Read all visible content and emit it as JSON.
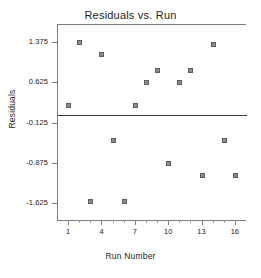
{
  "chart_data": {
    "type": "scatter",
    "title": "Residuals vs. Run",
    "xlabel": "Run Number",
    "ylabel": "Residuals",
    "x": [
      1,
      2,
      3,
      4,
      5,
      6,
      7,
      8,
      9,
      10,
      11,
      12,
      13,
      14,
      15,
      16
    ],
    "values": [
      0.2,
      1.375,
      -1.6,
      1.15,
      -0.45,
      -1.6,
      0.2,
      0.625,
      0.85,
      -0.875,
      0.625,
      0.85,
      -1.1,
      1.35,
      -0.45,
      -1.1
    ],
    "series": [
      {
        "name": "Residuals",
        "values": [
          0.2,
          1.375,
          -1.6,
          1.15,
          -0.45,
          -1.6,
          0.2,
          0.625,
          0.85,
          -0.875,
          0.625,
          0.85,
          -1.1,
          1.35,
          -0.45,
          -1.1
        ]
      }
    ],
    "points": [
      {
        "x": 1,
        "y": 0.2
      },
      {
        "x": 2,
        "y": 1.375
      },
      {
        "x": 3,
        "y": -1.6
      },
      {
        "x": 4,
        "y": 1.15
      },
      {
        "x": 5,
        "y": -0.45
      },
      {
        "x": 6,
        "y": -1.6
      },
      {
        "x": 7,
        "y": 0.2
      },
      {
        "x": 8,
        "y": 0.625
      },
      {
        "x": 9,
        "y": 0.85
      },
      {
        "x": 10,
        "y": -0.875
      },
      {
        "x": 11,
        "y": 0.625
      },
      {
        "x": 12,
        "y": 0.85
      },
      {
        "x": 13,
        "y": -1.1
      },
      {
        "x": 14,
        "y": 1.35
      },
      {
        "x": 15,
        "y": -0.45
      },
      {
        "x": 16,
        "y": -1.1
      }
    ],
    "xlim": [
      0,
      17
    ],
    "ylim": [
      -1.95,
      1.72
    ],
    "xticks": [
      1,
      4,
      7,
      10,
      13,
      16
    ],
    "xtick_labels": [
      "1",
      "4",
      "7",
      "10",
      "13",
      "16"
    ],
    "xticks_minor": [
      2,
      3,
      5,
      6,
      8,
      9,
      11,
      12,
      14,
      15
    ],
    "yticks": [
      1.375,
      0.625,
      -0.125,
      -0.875,
      -1.625
    ],
    "ytick_labels": [
      "1.375",
      "0.625",
      "-0.125",
      "-0.875",
      "-1.625"
    ],
    "reference_line": {
      "y": 0.03,
      "label": ""
    },
    "grid": false,
    "legend": null,
    "marker_color": "#8b8b8b",
    "marker_edge_color": "#5e5e5e",
    "axis_color": "#7b7b7b",
    "reference_line_color": "#3a3a3a",
    "text_color": "#1c1c1c",
    "background": "#ffffff"
  }
}
